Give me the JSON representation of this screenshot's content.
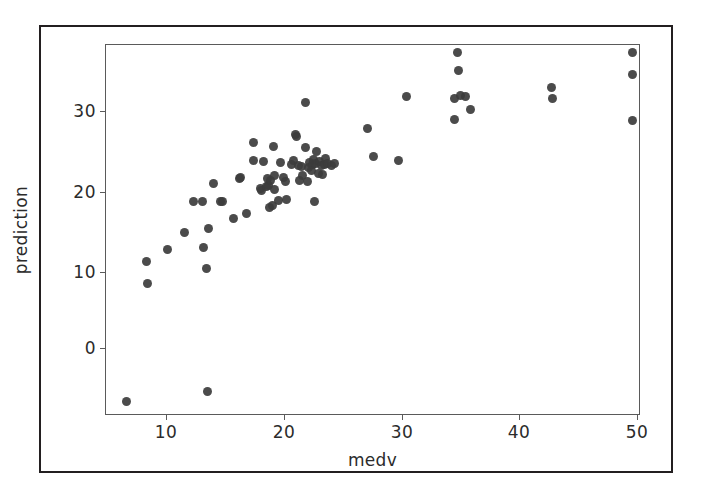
{
  "figure": {
    "background_color": "#ffffff",
    "outer_frame_color": "#231f20",
    "axes_frame_color": "#5a5a5a",
    "marker_color": "#3c3c3c"
  },
  "chart_data": {
    "type": "scatter",
    "title": "",
    "xlabel": "medv",
    "ylabel": "prediction",
    "xlim": [
      5.3,
      50.7
    ],
    "ylim": [
      -8.0,
      36.8
    ],
    "xticks": [
      10,
      20,
      30,
      40,
      50
    ],
    "xticklabels": [
      "10",
      "20",
      "30",
      "40",
      "50"
    ],
    "yticks": [
      0,
      10,
      20,
      30
    ],
    "yticklabels": [
      "0",
      "10",
      "20",
      "30"
    ],
    "grid": false,
    "legend": null,
    "marker": "circle",
    "n_points": 86,
    "series": [
      {
        "name": "prediction vs medv",
        "points": [
          [
            7.0,
            -6.2
          ],
          [
            8.7,
            10.7
          ],
          [
            8.8,
            8.0
          ],
          [
            10.5,
            12.1
          ],
          [
            12.0,
            14.1
          ],
          [
            12.7,
            17.9
          ],
          [
            13.5,
            17.9
          ],
          [
            13.6,
            12.4
          ],
          [
            13.8,
            9.8
          ],
          [
            13.9,
            -5.1
          ],
          [
            14.0,
            14.7
          ],
          [
            14.4,
            20.1
          ],
          [
            15.0,
            17.9
          ],
          [
            15.2,
            17.9
          ],
          [
            16.1,
            15.8
          ],
          [
            16.6,
            20.7
          ],
          [
            16.7,
            20.8
          ],
          [
            17.2,
            16.5
          ],
          [
            17.8,
            25.0
          ],
          [
            17.8,
            22.8
          ],
          [
            18.4,
            19.5
          ],
          [
            18.5,
            19.2
          ],
          [
            18.7,
            22.7
          ],
          [
            18.9,
            19.7
          ],
          [
            19.0,
            20.7
          ],
          [
            19.1,
            19.8
          ],
          [
            19.2,
            17.2
          ],
          [
            19.3,
            20.4
          ],
          [
            19.4,
            17.4
          ],
          [
            19.5,
            24.6
          ],
          [
            19.6,
            19.3
          ],
          [
            19.6,
            21.0
          ],
          [
            19.9,
            18.0
          ],
          [
            20.1,
            22.6
          ],
          [
            20.4,
            20.8
          ],
          [
            20.5,
            20.3
          ],
          [
            20.6,
            18.2
          ],
          [
            21.0,
            22.4
          ],
          [
            21.2,
            22.9
          ],
          [
            21.4,
            26.0
          ],
          [
            21.5,
            25.7
          ],
          [
            21.6,
            22.3
          ],
          [
            21.7,
            20.4
          ],
          [
            21.9,
            22.1
          ],
          [
            22.0,
            21.0
          ],
          [
            22.2,
            29.8
          ],
          [
            22.2,
            24.4
          ],
          [
            22.4,
            20.3
          ],
          [
            22.5,
            22.0
          ],
          [
            22.6,
            22.6
          ],
          [
            22.7,
            21.6
          ],
          [
            22.8,
            22.4
          ],
          [
            22.9,
            23.0
          ],
          [
            23.0,
            17.9
          ],
          [
            23.1,
            22.5
          ],
          [
            23.2,
            24.0
          ],
          [
            23.3,
            21.3
          ],
          [
            23.4,
            22.7
          ],
          [
            23.6,
            22.2
          ],
          [
            23.7,
            21.2
          ],
          [
            23.8,
            22.4
          ],
          [
            23.9,
            23.1
          ],
          [
            24.1,
            22.5
          ],
          [
            24.4,
            22.3
          ],
          [
            24.7,
            22.5
          ],
          [
            27.5,
            26.7
          ],
          [
            28.0,
            23.3
          ],
          [
            30.1,
            22.9
          ],
          [
            30.8,
            30.6
          ],
          [
            34.9,
            30.3
          ],
          [
            34.9,
            27.8
          ],
          [
            35.1,
            35.9
          ],
          [
            35.2,
            33.7
          ],
          [
            35.4,
            30.7
          ],
          [
            35.8,
            30.6
          ],
          [
            36.2,
            29.0
          ],
          [
            43.1,
            31.7
          ],
          [
            43.2,
            30.3
          ],
          [
            50.0,
            35.9
          ],
          [
            50.0,
            33.2
          ],
          [
            50.0,
            27.7
          ]
        ]
      }
    ]
  }
}
